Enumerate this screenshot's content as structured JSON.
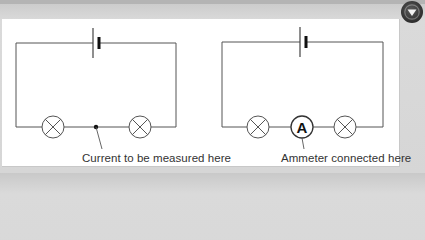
{
  "figure": {
    "left_circuit": {
      "components": [
        "cell",
        "lamp",
        "junction-point",
        "lamp"
      ],
      "label": "Current to be measured here"
    },
    "right_circuit": {
      "components": [
        "cell",
        "lamp",
        "ammeter",
        "lamp"
      ],
      "ammeter_symbol": "A",
      "label": "Ammeter connected here"
    }
  },
  "controls": {
    "dropdown_icon": "chevron-down-circle-icon"
  },
  "colors": {
    "wire": "#555555",
    "panel": "#ffffff",
    "background": "#d6d6d6",
    "button": "#2e2e2e"
  }
}
